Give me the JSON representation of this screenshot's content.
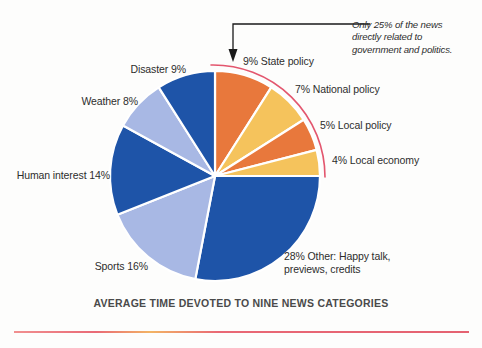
{
  "figure": {
    "title": "AVERAGE TIME DEVOTED TO NINE NEWS CATEGORIES",
    "annotation": "Only 25% of the news\ndirectly related to\ngovernment and politics.",
    "background_color": "#fdfdfc"
  },
  "labels": {
    "state_policy": "9% State policy",
    "national_policy": "7% National policy",
    "local_policy": "5% Local policy",
    "local_economy": "4% Local economy",
    "other": "28% Other: Happy talk,\npreviews, credits",
    "sports": "Sports 16%",
    "human_interest": "Human interest 14%",
    "weather": "Weather 8%",
    "disaster": "Disaster 9%"
  },
  "colors": {
    "orange": "#E8783C",
    "yellow": "#F5C35C",
    "dark_blue": "#1E54A8",
    "light_blue": "#A8B8E4",
    "pink_arc": "#E3566E",
    "arrow": "#1a1a1a",
    "text": "#2d2d2d",
    "title_text": "#4a4a4a"
  },
  "chart_data": {
    "type": "pie",
    "title": "AVERAGE TIME DEVOTED TO NINE NEWS CATEGORIES",
    "unit": "percent",
    "start_angle_deg": 0,
    "direction": "clockwise",
    "total": 100,
    "grid": false,
    "legend": "none",
    "annotations": [
      {
        "text": "Only 25% of the news directly related to government and politics.",
        "points_to": "9% State policy",
        "style": "italic-with-elbow-arrow"
      },
      {
        "text": "pink arc bracket spanning government/politics slices",
        "covers": [
          "9% State policy",
          "7% National policy",
          "5% Local policy",
          "4% Local economy"
        ],
        "sum": 25
      }
    ],
    "categories": [
      "State policy",
      "National policy",
      "Local policy",
      "Local economy",
      "Other: Happy talk, previews, credits",
      "Sports",
      "Human interest",
      "Weather",
      "Disaster"
    ],
    "values": [
      9,
      7,
      5,
      4,
      28,
      16,
      14,
      8,
      9
    ],
    "slice_colors": [
      "#E8783C",
      "#F5C35C",
      "#E8783C",
      "#F5C35C",
      "#1E54A8",
      "#A8B8E4",
      "#1E54A8",
      "#A8B8E4",
      "#1E54A8"
    ],
    "slices": [
      {
        "label": "State policy",
        "display": "9% State policy",
        "value": 9,
        "color": "#E8783C"
      },
      {
        "label": "National policy",
        "display": "7% National policy",
        "value": 7,
        "color": "#F5C35C"
      },
      {
        "label": "Local policy",
        "display": "5% Local policy",
        "value": 5,
        "color": "#E8783C"
      },
      {
        "label": "Local economy",
        "display": "4% Local economy",
        "value": 4,
        "color": "#F5C35C"
      },
      {
        "label": "Other",
        "display": "28% Other: Happy talk, previews, credits",
        "value": 28,
        "color": "#1E54A8"
      },
      {
        "label": "Sports",
        "display": "Sports 16%",
        "value": 16,
        "color": "#A8B8E4"
      },
      {
        "label": "Human interest",
        "display": "Human interest 14%",
        "value": 14,
        "color": "#1E54A8"
      },
      {
        "label": "Weather",
        "display": "Weather 8%",
        "value": 8,
        "color": "#A8B8E4"
      },
      {
        "label": "Disaster",
        "display": "Disaster 9%",
        "value": 9,
        "color": "#1E54A8"
      }
    ]
  }
}
